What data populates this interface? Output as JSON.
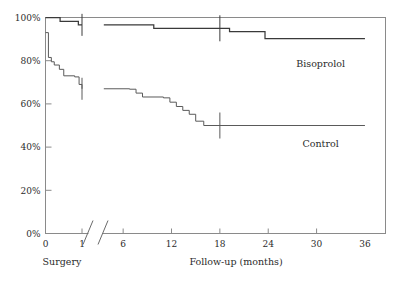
{
  "chart_data": {
    "type": "line",
    "subtype": "kaplan-meier-step",
    "title": "",
    "xlabel": "Follow-up (months)",
    "ylabel": "",
    "origin_label": "Surgery",
    "grid": false,
    "legend_position": "inline-right",
    "xlim": [
      0,
      36
    ],
    "ylim": [
      0,
      100
    ],
    "x_axis_break": {
      "present": true,
      "after": 1,
      "resume_at": 3.5
    },
    "xticks": [
      0,
      1,
      6,
      12,
      18,
      24,
      30,
      36
    ],
    "xtick_labels": [
      "0",
      "1",
      "6",
      "12",
      "18",
      "24",
      "30",
      "36"
    ],
    "yticks": [
      0,
      20,
      40,
      60,
      80,
      100
    ],
    "ytick_labels": [
      "0%",
      "20%",
      "40%",
      "60%",
      "80%",
      "100%"
    ],
    "series": [
      {
        "name": "Bisoprolol",
        "label_x": 30.5,
        "label_y": 77,
        "color": "#3a3a3a",
        "steps": [
          {
            "x": 0.0,
            "y": 100.0
          },
          {
            "x": 0.4,
            "y": 98.2
          },
          {
            "x": 0.9,
            "y": 96.6
          },
          {
            "x": 1.0,
            "y": 96.6
          },
          {
            "x": 3.6,
            "y": 96.6
          },
          {
            "x": 9.8,
            "y": 95.0
          },
          {
            "x": 18.0,
            "y": 95.0
          },
          {
            "x": 19.2,
            "y": 93.5
          },
          {
            "x": 23.6,
            "y": 90.2
          },
          {
            "x": 36.0,
            "y": 90.2
          }
        ],
        "censored": [
          {
            "x": 1.0,
            "y": 96.6
          },
          {
            "x": 18.0,
            "y": 95.0
          }
        ]
      },
      {
        "name": "Control",
        "label_x": 30.5,
        "label_y": 40,
        "color": "#5a5a5a",
        "steps": [
          {
            "x": 0.0,
            "y": 93.0
          },
          {
            "x": 0.08,
            "y": 81.5
          },
          {
            "x": 0.16,
            "y": 79.5
          },
          {
            "x": 0.24,
            "y": 78.0
          },
          {
            "x": 0.38,
            "y": 76.0
          },
          {
            "x": 0.5,
            "y": 73.0
          },
          {
            "x": 0.8,
            "y": 72.5
          },
          {
            "x": 0.92,
            "y": 69.0
          },
          {
            "x": 1.0,
            "y": 67.0
          },
          {
            "x": 3.6,
            "y": 67.0
          },
          {
            "x": 6.8,
            "y": 66.8
          },
          {
            "x": 7.6,
            "y": 65.0
          },
          {
            "x": 8.4,
            "y": 63.2
          },
          {
            "x": 11.0,
            "y": 62.8
          },
          {
            "x": 11.8,
            "y": 60.8
          },
          {
            "x": 12.6,
            "y": 58.8
          },
          {
            "x": 13.4,
            "y": 57.0
          },
          {
            "x": 14.2,
            "y": 55.2
          },
          {
            "x": 15.0,
            "y": 52.0
          },
          {
            "x": 16.0,
            "y": 50.0
          },
          {
            "x": 36.0,
            "y": 50.0
          }
        ],
        "censored": [
          {
            "x": 1.0,
            "y": 67.0
          },
          {
            "x": 18.0,
            "y": 50.0
          }
        ]
      }
    ]
  }
}
